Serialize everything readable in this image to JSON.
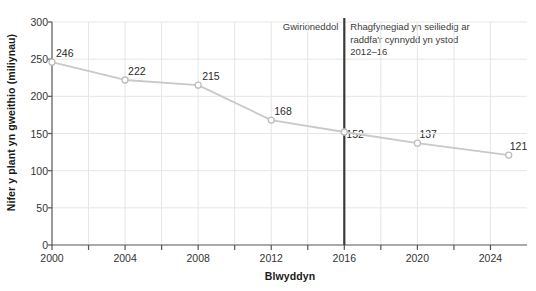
{
  "chart_data": {
    "type": "line",
    "title": "",
    "xlabel": "Blwyddyn",
    "ylabel": "Nifer y plant yn gweithio (miliynau)",
    "xlim": [
      2000,
      2026
    ],
    "ylim": [
      0,
      300
    ],
    "grid": true,
    "legend_position": "none",
    "x": [
      2000,
      2004,
      2008,
      2012,
      2016,
      2020,
      2025
    ],
    "values": [
      246,
      222,
      215,
      168,
      152,
      137,
      121
    ],
    "point_labels": [
      "246",
      "222",
      "215",
      "168",
      "152",
      "137",
      "121"
    ],
    "xticks": [
      "2000",
      "2004",
      "2008",
      "2012",
      "2016",
      "2020",
      "2024"
    ],
    "xtick_values": [
      2000,
      2004,
      2008,
      2012,
      2016,
      2020,
      2024
    ],
    "yticks": [
      "0",
      "50",
      "100",
      "150",
      "200",
      "250",
      "300"
    ],
    "ytick_values": [
      0,
      50,
      100,
      150,
      200,
      250,
      300
    ],
    "annotations": [
      {
        "name": "actual",
        "text": "Gwirioneddol",
        "x": 2016
      },
      {
        "name": "forecast",
        "text": "Rhagfynegiad yn seiliedig ar raddfa'r cynnydd yn ystod 2012–16",
        "x": 2016
      }
    ],
    "divider_year": 2016,
    "colors": {
      "line": "#c9c9c9",
      "marker_stroke": "#bdbdbd",
      "marker_fill": "#ffffff",
      "grid": "#e6e6e6",
      "axis": "#555555",
      "divider": "#3a3a3a",
      "text": "#2b2b2b",
      "background": "#ffffff"
    }
  }
}
